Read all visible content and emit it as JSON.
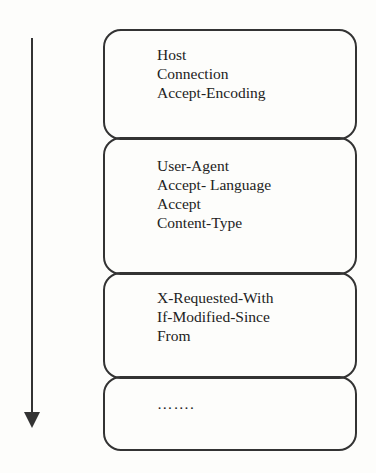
{
  "diagram": {
    "arrow": {
      "direction": "down",
      "color": "#333333"
    },
    "boxes": [
      {
        "lines": [
          "Host",
          "Connection",
          "Accept-Encoding"
        ]
      },
      {
        "lines": [
          "User-Agent",
          "Accept- Language",
          "Accept",
          "Content-Type"
        ]
      },
      {
        "lines": [
          "X-Requested-With",
          "If-Modified-Since",
          "From"
        ]
      },
      {
        "lines": [
          "……."
        ]
      }
    ],
    "stroke_color": "#333333",
    "text_color": "#222222"
  }
}
